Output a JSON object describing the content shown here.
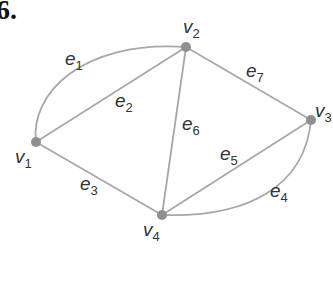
{
  "problem_number": "6.",
  "graph": {
    "edge_color": "#a8a8a8",
    "vertex_color": "#8f8f8f",
    "vertices": [
      {
        "id": "v1",
        "name": "v",
        "sub": "1",
        "x": 36,
        "y": 142
      },
      {
        "id": "v2",
        "name": "v",
        "sub": "2",
        "x": 186,
        "y": 47
      },
      {
        "id": "v3",
        "name": "v",
        "sub": "3",
        "x": 311,
        "y": 120
      },
      {
        "id": "v4",
        "name": "v",
        "sub": "4",
        "x": 162,
        "y": 215
      }
    ],
    "edges": [
      {
        "id": "e1",
        "name": "e",
        "sub": "1",
        "from": "v1",
        "to": "v2",
        "curved": true
      },
      {
        "id": "e2",
        "name": "e",
        "sub": "2",
        "from": "v1",
        "to": "v2",
        "curved": false
      },
      {
        "id": "e3",
        "name": "e",
        "sub": "3",
        "from": "v1",
        "to": "v4",
        "curved": false
      },
      {
        "id": "e4",
        "name": "e",
        "sub": "4",
        "from": "v3",
        "to": "v4",
        "curved": true
      },
      {
        "id": "e5",
        "name": "e",
        "sub": "5",
        "from": "v3",
        "to": "v4",
        "curved": false
      },
      {
        "id": "e6",
        "name": "e",
        "sub": "6",
        "from": "v2",
        "to": "v4",
        "curved": false
      },
      {
        "id": "e7",
        "name": "e",
        "sub": "7",
        "from": "v2",
        "to": "v3",
        "curved": false
      }
    ]
  }
}
